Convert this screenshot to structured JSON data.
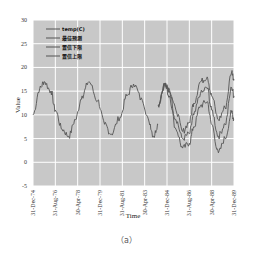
{
  "chart_data": {
    "type": "line",
    "title": "",
    "xlabel": "Time",
    "ylabel": "Value",
    "ylim": [
      -5,
      30
    ],
    "yticks": [
      -5,
      0,
      5,
      10,
      15,
      20,
      25,
      30
    ],
    "xticks": [
      "31-Dec-74",
      "31-Aug-76",
      "30-Apr-78",
      "31-Dec-79",
      "31-Aug-81",
      "30-Apr-83",
      "31-Dec-84",
      "31-Aug-86",
      "30-Apr-88",
      "31-Dec-89"
    ],
    "grid": true,
    "legend_position": "upper left",
    "legend": [
      "temp(C)",
      "最佳预测",
      "置信下限",
      "置信上限"
    ],
    "x_range_index": [
      0,
      9
    ],
    "series": [
      {
        "name": "temp(C)",
        "x": [
          0,
          0.3,
          0.5,
          0.8,
          1.0,
          1.3,
          1.6,
          1.9,
          2.2,
          2.5,
          2.9,
          3.2,
          3.5,
          3.9,
          4.2,
          4.5,
          4.9,
          5.2,
          5.4,
          5.6
        ],
        "values": [
          10,
          15.5,
          17,
          15,
          11,
          7,
          5.5,
          9,
          14,
          17,
          13,
          8,
          6,
          9.5,
          14,
          16.5,
          13,
          8.5,
          5.5,
          8
        ]
      },
      {
        "name": "最佳预测",
        "x": [
          5.6,
          5.9,
          6.1,
          6.4,
          6.7,
          7.0,
          7.2,
          7.5,
          7.8,
          8.0,
          8.3,
          8.6,
          8.9,
          9.0
        ],
        "values": [
          12,
          16.5,
          15,
          9,
          5,
          6,
          10,
          14.5,
          15.7,
          11,
          5.5,
          8,
          15.7,
          14
        ]
      },
      {
        "name": "置信下限",
        "x": [
          5.6,
          5.9,
          6.1,
          6.4,
          6.7,
          7.0,
          7.2,
          7.5,
          7.8,
          8.0,
          8.3,
          8.6,
          8.9,
          9.0
        ],
        "values": [
          12,
          16.5,
          14,
          7,
          3,
          4,
          7.5,
          12,
          12.8,
          8,
          2,
          5,
          10.5,
          9
        ]
      },
      {
        "name": "置信上限",
        "x": [
          5.6,
          5.9,
          6.1,
          6.4,
          6.7,
          7.0,
          7.2,
          7.5,
          7.8,
          8.0,
          8.3,
          8.6,
          8.9,
          9.0
        ],
        "values": [
          12,
          16.5,
          15.5,
          11,
          6.5,
          8.5,
          12.5,
          17,
          18,
          14,
          9,
          11.5,
          19.1,
          17.5
        ]
      }
    ],
    "colors": {
      "background": "#c8c8c8",
      "grid": "#ffffff",
      "line": "#555555"
    }
  },
  "caption": "（a）"
}
